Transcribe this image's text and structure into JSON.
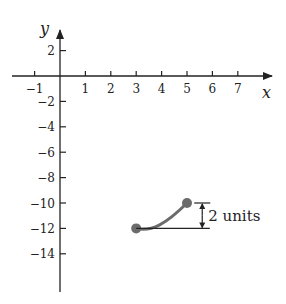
{
  "chart_data": {
    "type": "line",
    "title": "",
    "xlabel": "x",
    "ylabel": "y",
    "xlim": [
      -1.5,
      8.2
    ],
    "ylim": [
      -15.8,
      4
    ],
    "grid": false,
    "x_ticks": [
      -1,
      1,
      2,
      3,
      4,
      5,
      6,
      7
    ],
    "x_tick_labels": [
      "−1",
      "1",
      "2",
      "3",
      "4",
      "5",
      "6",
      "7"
    ],
    "y_ticks": [
      2,
      -2,
      -4,
      -6,
      -8,
      -10,
      -12,
      -14
    ],
    "y_tick_labels": [
      "2",
      "−2",
      "−4",
      "−6",
      "−8",
      "−10",
      "−12",
      "−14"
    ],
    "series": [
      {
        "name": "curve segment",
        "points": [
          [
            3,
            -12
          ],
          [
            3.5,
            -12.05
          ],
          [
            4,
            -11.7
          ],
          [
            4.5,
            -10.9
          ],
          [
            5,
            -10
          ]
        ],
        "endpoints": [
          [
            3,
            -12
          ],
          [
            5,
            -10
          ]
        ],
        "color": "#6b6b6b"
      }
    ],
    "annotations": [
      {
        "type": "vertical-dimension",
        "from": [
          5.6,
          -12
        ],
        "to": [
          5.6,
          -10
        ],
        "label": "2 units"
      },
      {
        "type": "horizontal-reference-line",
        "from": [
          3,
          -12
        ],
        "to": [
          5.9,
          -12
        ]
      }
    ]
  },
  "labels": {
    "x_axis": "x",
    "y_axis": "y",
    "dimension": "2 units"
  },
  "colors": {
    "axis": "#222222",
    "curve": "#6b6b6b",
    "point": "#6b6b6b",
    "text": "#222222"
  }
}
